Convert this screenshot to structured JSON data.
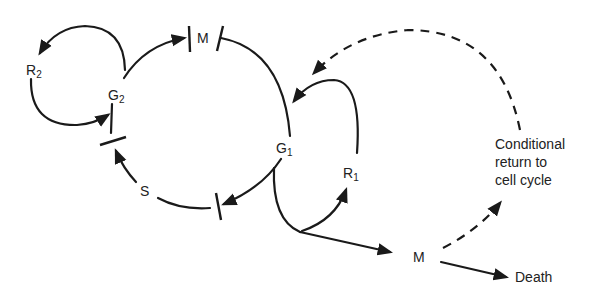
{
  "diagram": {
    "type": "cell-cycle",
    "nodes": {
      "R2": {
        "label": "R",
        "sub": "2"
      },
      "G2": {
        "label": "G",
        "sub": "2"
      },
      "M_top": {
        "label": "M"
      },
      "G1": {
        "label": "G",
        "sub": "1"
      },
      "S": {
        "label": "S"
      },
      "R1": {
        "label": "R",
        "sub": "1"
      },
      "M_bottom": {
        "label": "M"
      },
      "Death": {
        "label": "Death"
      }
    },
    "note": {
      "line1": "Conditional",
      "line2": "return to",
      "line3": "cell cycle"
    },
    "colors": {
      "line": "#1a1a1a",
      "text": "#222222",
      "background": "#ffffff"
    }
  }
}
